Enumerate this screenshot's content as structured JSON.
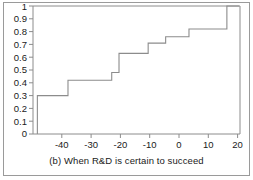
{
  "caption": "(b)  When R&D is certain to succeed",
  "colors": {
    "frame": "#9a9a9a",
    "axis": "#8c8c8c",
    "curve": "#8c8c8c",
    "text": "#1a1a1a",
    "background": "#ffffff"
  },
  "chart_data": {
    "type": "line",
    "subtype": "step-cdf",
    "title": "",
    "subtitle": "",
    "caption": "(b)  When R&D is certain to succeed",
    "xlabel": "",
    "ylabel": "",
    "xlim": [
      -49.5,
      21.5
    ],
    "ylim": [
      0,
      1
    ],
    "grid": false,
    "legend": null,
    "xticks": [
      -40,
      -30,
      -20,
      -10,
      0,
      10,
      20
    ],
    "xtick_labels": [
      "-40",
      "-30",
      "-20",
      "-10",
      "0",
      "10",
      "20"
    ],
    "yticks": [
      0,
      0.1,
      0.2,
      0.3,
      0.4,
      0.5,
      0.6,
      0.7,
      0.8,
      0.9,
      1
    ],
    "ytick_labels": [
      "0",
      "0.1",
      "0.2",
      "0.3",
      "0.4",
      "0.5",
      "0.6",
      "0.7",
      "0.8",
      "0.9",
      "1"
    ],
    "series": [
      {
        "name": "cumulative distribution",
        "step_x": [
          -48,
          -48,
          -37.5,
          -37.5,
          -22.5,
          -22.5,
          -20,
          -20,
          -10,
          -10,
          -4,
          -4,
          4,
          4,
          17,
          17,
          21.2
        ],
        "step_y": [
          0,
          0.3,
          0.3,
          0.42,
          0.42,
          0.48,
          0.48,
          0.63,
          0.63,
          0.71,
          0.71,
          0.76,
          0.76,
          0.82,
          0.82,
          1,
          1
        ],
        "steps": [
          {
            "x": -48,
            "y": 0.3
          },
          {
            "x": -37.5,
            "y": 0.42
          },
          {
            "x": -22.5,
            "y": 0.48
          },
          {
            "x": -20,
            "y": 0.63
          },
          {
            "x": -10,
            "y": 0.71
          },
          {
            "x": -4,
            "y": 0.76
          },
          {
            "x": 4,
            "y": 0.82
          },
          {
            "x": 17,
            "y": 1.0
          }
        ]
      }
    ]
  }
}
